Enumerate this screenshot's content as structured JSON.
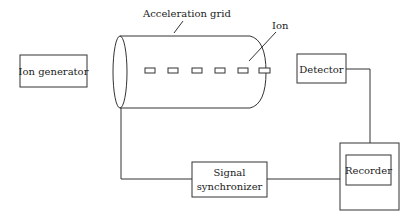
{
  "diagram": {
    "title": "",
    "labels": {
      "acceleration_grid": "Acceleration grid",
      "ion": "Ion",
      "ion_generator": "Ion generator",
      "detector": "Detector",
      "signal_line1": "Signal",
      "signal_line2": "synchronizer",
      "recorder": "Recorder"
    },
    "colors": {
      "stroke": "#333333",
      "text": "#222222",
      "background": "#ffffff"
    }
  }
}
